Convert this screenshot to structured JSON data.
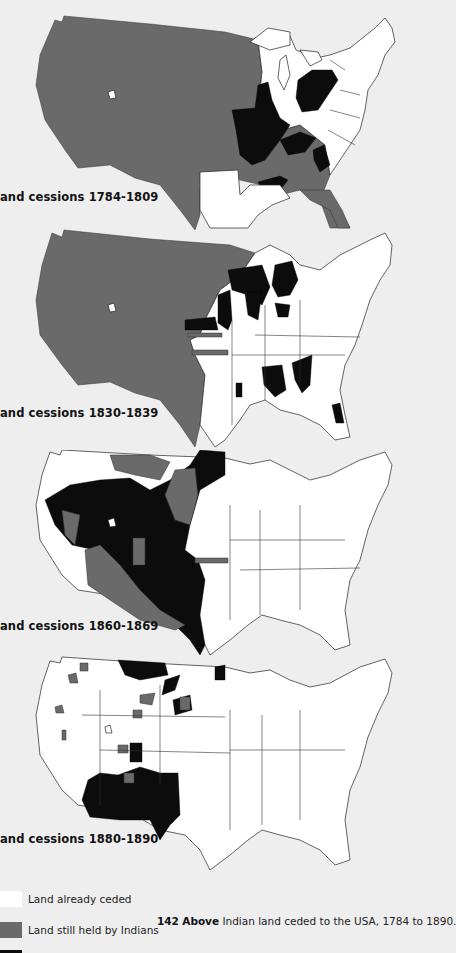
{
  "figure": {
    "number": "142",
    "caption_lead": "Above",
    "caption_text": "Indian land ceded to the USA, 1784 to 1890."
  },
  "colors": {
    "background": "#eeeeee",
    "ceded": "#ffffff",
    "held_by_indians": "#6a6a6a",
    "cessions_in_period": "#0c0c0c",
    "outline": "#222222"
  },
  "maps": [
    {
      "title": "and cessions 1784-1809",
      "period": "1784-1809"
    },
    {
      "title": "and cessions 1830-1839",
      "period": "1830-1839"
    },
    {
      "title": "and cessions 1860-1869",
      "period": "1860-1869"
    },
    {
      "title": "and cessions 1880-1890",
      "period": "1880-1890"
    }
  ],
  "legend": [
    {
      "label": "Land already ceded",
      "color": "#ffffff"
    },
    {
      "label": "Land still held by Indians",
      "color": "#6a6a6a"
    },
    {
      "label": "",
      "color": "#0c0c0c"
    }
  ]
}
